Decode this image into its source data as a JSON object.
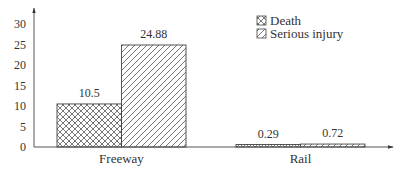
{
  "chart_data": {
    "type": "bar",
    "title": "",
    "xlabel": "",
    "ylabel": "",
    "categories": [
      "Freeway",
      "Rail"
    ],
    "series": [
      {
        "name": "Death",
        "values": [
          10.5,
          0.29
        ],
        "pattern": "crosshatch"
      },
      {
        "name": "Serious injury",
        "values": [
          24.88,
          0.72
        ],
        "pattern": "diagonal"
      }
    ],
    "data_labels": [
      [
        "10.5",
        "0.29"
      ],
      [
        "24.88",
        "0.72"
      ]
    ],
    "yticks": [
      0,
      5,
      10,
      15,
      20,
      25,
      30
    ],
    "ytick_labels": [
      "0",
      "5",
      "10",
      "15",
      "20",
      "25",
      "30"
    ],
    "ylim": [
      0,
      33
    ],
    "grid": false,
    "legend_position": "upper-right-inside",
    "colors": {
      "stroke": "#444444",
      "fill": "#ffffff",
      "text": "#333333"
    }
  },
  "legend": {
    "items": [
      {
        "label": "Death"
      },
      {
        "label": "Serious injury"
      }
    ]
  }
}
